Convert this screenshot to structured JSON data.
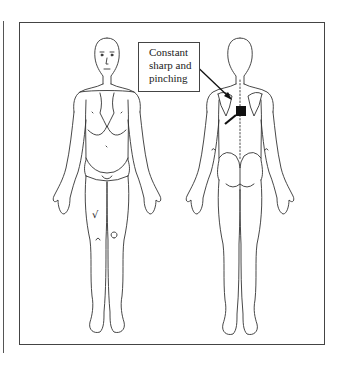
{
  "diagram": {
    "type": "body-pain-chart",
    "views": [
      {
        "name": "front",
        "marks": [
          {
            "symbol": "√",
            "location": "right anterior thigh"
          }
        ]
      },
      {
        "name": "back",
        "marks": [
          {
            "symbol": "filled-square",
            "location": "upper thoracic spine / between scapulae"
          }
        ]
      }
    ],
    "callout": {
      "lines": [
        "Constant",
        "sharp and",
        "pinching"
      ],
      "points_to": "back view, left shoulder blade region"
    },
    "front_marks": {
      "check": "√"
    },
    "colors": {
      "line": "#333333",
      "mark": "#111111",
      "background": "#ffffff"
    }
  }
}
